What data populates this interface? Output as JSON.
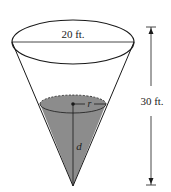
{
  "diagram": {
    "type": "cone-tank",
    "labels": {
      "top_diameter": "20 ft.",
      "height": "30 ft.",
      "radius_var": "r",
      "depth_var": "d"
    },
    "colors": {
      "stroke": "#1a1a1a",
      "water_fill": "#8c8c8c",
      "background": "#ffffff"
    }
  }
}
